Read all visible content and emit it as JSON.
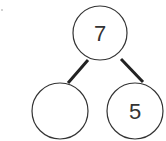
{
  "diagram": {
    "type": "number-bond",
    "whole": {
      "value": "7"
    },
    "parts": [
      {
        "value": ""
      },
      {
        "value": "5"
      }
    ],
    "colors": {
      "stroke": "#333333",
      "connector": "#222222",
      "background": "#ffffff"
    }
  }
}
